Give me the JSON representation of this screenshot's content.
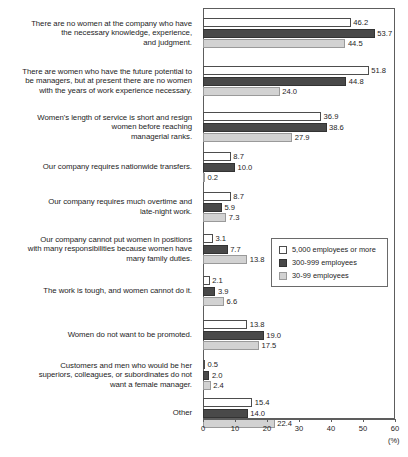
{
  "chart_data": {
    "type": "bar",
    "orientation": "horizontal",
    "title": "",
    "xlabel": "(%)",
    "ylabel": "",
    "xlim": [
      0,
      60
    ],
    "xticks": [
      0,
      10,
      20,
      30,
      40,
      50,
      60
    ],
    "xtick_labels": [
      "0",
      "10",
      "20",
      "30",
      "40",
      "50",
      "60"
    ],
    "grid": false,
    "legend_position": "middle-right",
    "categories": [
      "There are no women at the company who have the necessary knowledge, experience, and judgment.",
      "There are women who have the future potential to be managers, but at present there are no women with the years of work experience necessary.",
      "Women's length of service is short and resign women before reaching managerial ranks.",
      "Our company requires nationwide transfers.",
      "Our company requires much overtime and late-night work.",
      "Our company cannot put women in positions with many responsibilities because women have many family duties.",
      "The work is tough, and women cannot do it.",
      "Women do not want to be promoted.",
      "Customers and men who would be her superiors, colleagues, or subordinates do not want a female manager.",
      "Other"
    ],
    "category_lines": [
      [
        "There are no women at the company who have",
        "the necessary knowledge, experience,",
        "and judgment."
      ],
      [
        "There are women who have the future potential to",
        "be managers, but at present there are no women",
        "with the years of work experience necessary."
      ],
      [
        "Women's length of service is short and resign",
        "women before reaching",
        "managerial ranks."
      ],
      [
        "Our company requires nationwide transfers."
      ],
      [
        "Our company requires much overtime and",
        "late-night work."
      ],
      [
        "Our company cannot put women in positions",
        "with many responsibilities because women have",
        "many family duties."
      ],
      [
        "The work is tough, and women cannot do it."
      ],
      [
        "Women do not want to be promoted."
      ],
      [
        "Customers and men who would be her",
        "superiors, colleagues, or subordinates do not",
        "want a female manager."
      ],
      [
        "Other"
      ]
    ],
    "series": [
      {
        "name": "5,000 employees or more",
        "color": "#ffffff",
        "values": [
          46.2,
          51.8,
          36.9,
          8.7,
          8.7,
          3.1,
          2.1,
          13.8,
          0.5,
          15.4
        ],
        "labels": [
          "46.2",
          "51.8",
          "36.9",
          "8.7",
          "8.7",
          "3.1",
          "2.1",
          "13.8",
          "0.5",
          "15.4"
        ]
      },
      {
        "name": "300-999 employees",
        "color": "#494949",
        "values": [
          53.7,
          44.8,
          38.6,
          10.0,
          5.9,
          7.7,
          3.9,
          19.0,
          2.0,
          14.0
        ],
        "labels": [
          "53.7",
          "44.8",
          "38.6",
          "10.0",
          "5.9",
          "7.7",
          "3.9",
          "19.0",
          "2.0",
          "14.0"
        ]
      },
      {
        "name": "30-99 employees",
        "color": "#d2d2d2",
        "values": [
          44.5,
          24.0,
          27.9,
          0.2,
          7.3,
          13.8,
          6.6,
          17.5,
          2.4,
          22.4
        ],
        "labels": [
          "44.5",
          "24.0",
          "27.9",
          "0.2",
          "7.3",
          "13.8",
          "6.6",
          "17.5",
          "2.4",
          "22.4"
        ]
      }
    ]
  },
  "legend": {
    "items": [
      {
        "label": "5,000 employees or more"
      },
      {
        "label": "300-999 employees"
      },
      {
        "label": "30-99 employees"
      }
    ]
  },
  "axis": {
    "unit": "(%)"
  },
  "footnote": {
    "text": ""
  }
}
